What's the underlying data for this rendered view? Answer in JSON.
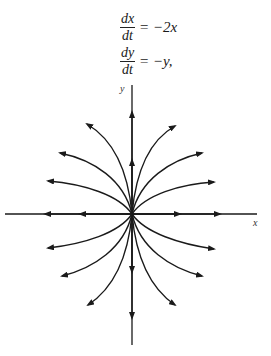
{
  "equations": [
    {
      "numerator": "dx",
      "denominator": "dt",
      "rhs": "= −2x"
    },
    {
      "numerator": "dy",
      "denominator": "dt",
      "rhs": "= −y,"
    }
  ],
  "diagram": {
    "type": "phase-portrait",
    "x_axis_label": "x",
    "y_axis_label": "y",
    "origin_px": [
      132,
      214
    ],
    "trajectory_family": "y^2 = c·|x| (parabolic curves tangent to y-axis)",
    "colors": {
      "line": "#1a1a1a",
      "background": "#ffffff"
    }
  }
}
